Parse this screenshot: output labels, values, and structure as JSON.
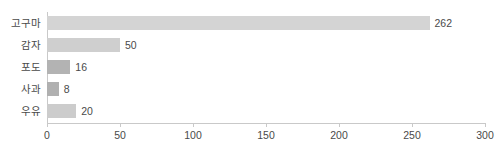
{
  "chart_data": {
    "type": "bar",
    "orientation": "horizontal",
    "title": "",
    "subtitle": "",
    "xlabel": "",
    "ylabel": "",
    "xlim": [
      0,
      300
    ],
    "ylim": null,
    "grid": false,
    "legend": null,
    "categories": [
      "고구마",
      "감자",
      "포도",
      "사과",
      "우유"
    ],
    "values": [
      262,
      50,
      16,
      8,
      20
    ],
    "data_labels": [
      "262",
      "50",
      "16",
      "8",
      "20"
    ],
    "bar_colors": [
      "#d4d4d4",
      "#cfcfcf",
      "#b3b3b3",
      "#b0b0b0",
      "#cccccc"
    ],
    "xticks": [
      0,
      50,
      100,
      150,
      200,
      250,
      300
    ],
    "xtick_labels": [
      "0",
      "50",
      "100",
      "150",
      "200",
      "250",
      "300"
    ],
    "axis_color": "#c9c9c9",
    "text_color": "#4a4a4a",
    "background": "#ffffff"
  }
}
